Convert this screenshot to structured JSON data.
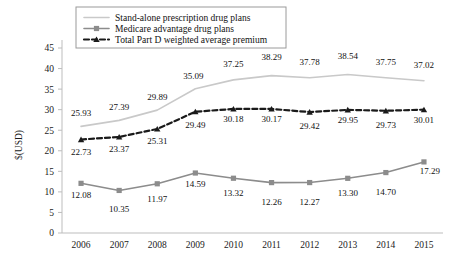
{
  "chart_data": {
    "type": "line",
    "title": "",
    "xlabel": "",
    "ylabel": "$(USD)",
    "categories": [
      "2006",
      "2007",
      "2008",
      "2009",
      "2010",
      "2011",
      "2012",
      "2013",
      "2014",
      "2015"
    ],
    "ylim": [
      0,
      45
    ],
    "ytick_step": 5,
    "yticks": [
      "0",
      "5",
      "10",
      "15",
      "20",
      "25",
      "30",
      "35",
      "40",
      "45"
    ],
    "grid": false,
    "legend_position": "top-center",
    "series": [
      {
        "name": "Stand-alone prescription drug plans",
        "color": "#c9c9c9",
        "marker": "none",
        "dash": "solid",
        "values": [
          25.93,
          27.39,
          29.89,
          35.09,
          37.25,
          38.29,
          37.78,
          38.54,
          37.75,
          37.02
        ],
        "labels": [
          "25.93",
          "27.39",
          "29.89",
          "35.09",
          "37.25",
          "38.29",
          "37.78",
          "38.54",
          "37.75",
          "37.02"
        ]
      },
      {
        "name": "Medicare advantage drug plans",
        "color": "#8c8c8c",
        "marker": "square",
        "dash": "solid",
        "values": [
          12.08,
          10.35,
          11.97,
          14.59,
          13.32,
          12.26,
          12.27,
          13.3,
          14.7,
          17.29
        ],
        "labels": [
          "12.08",
          "10.35",
          "11.97",
          "14.59",
          "13.32",
          "12.26",
          "12.27",
          "13.30",
          "14.70",
          "17.29"
        ]
      },
      {
        "name": "Total Part D weighted average premium",
        "color": "#1a1a1a",
        "marker": "triangle",
        "dash": "dashed",
        "values": [
          22.73,
          23.37,
          25.31,
          29.49,
          30.18,
          30.17,
          29.42,
          29.95,
          29.73,
          30.01
        ],
        "labels": [
          "22.73",
          "23.37",
          "25.31",
          "29.49",
          "30.18",
          "30.17",
          "29.42",
          "29.95",
          "29.73",
          "30.01"
        ]
      }
    ]
  },
  "legend": {
    "items": [
      {
        "label": "Stand-alone prescription drug plans"
      },
      {
        "label": "Medicare advantage drug plans"
      },
      {
        "label": "Total Part D weighted average premium"
      }
    ]
  },
  "axis": {
    "y_title": "$(USD)"
  }
}
